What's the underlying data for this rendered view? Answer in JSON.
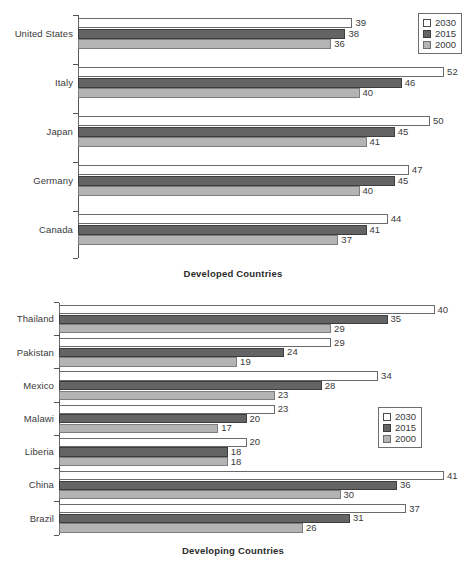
{
  "chart_data": [
    {
      "type": "bar",
      "orientation": "horizontal",
      "title": "",
      "xlabel": "Developed Countries",
      "ylabel": "",
      "grid": false,
      "xlim": [
        0,
        52
      ],
      "legend_position": "top-right",
      "categories": [
        "United States",
        "Italy",
        "Japan",
        "Germany",
        "Canada"
      ],
      "series": [
        {
          "name": "2030",
          "color": "#ffffff",
          "values": [
            39,
            52,
            50,
            47,
            44
          ]
        },
        {
          "name": "2015",
          "color": "#646464",
          "values": [
            38,
            46,
            45,
            45,
            41
          ]
        },
        {
          "name": "2000",
          "color": "#b4b4b4",
          "values": [
            36,
            40,
            41,
            40,
            37
          ]
        }
      ]
    },
    {
      "type": "bar",
      "orientation": "horizontal",
      "title": "",
      "xlabel": "Developing Countries",
      "ylabel": "",
      "grid": false,
      "xlim": [
        0,
        41
      ],
      "legend_position": "middle-right",
      "categories": [
        "Thailand",
        "Pakistan",
        "Mexico",
        "Malawi",
        "Liberia",
        "China",
        "Brazil"
      ],
      "series": [
        {
          "name": "2030",
          "color": "#ffffff",
          "values": [
            40,
            29,
            34,
            23,
            20,
            41,
            37
          ]
        },
        {
          "name": "2015",
          "color": "#646464",
          "values": [
            35,
            24,
            28,
            20,
            18,
            36,
            31
          ]
        },
        {
          "name": "2000",
          "color": "#b4b4b4",
          "values": [
            29,
            19,
            23,
            17,
            18,
            30,
            26
          ]
        }
      ]
    }
  ],
  "legend": {
    "items": [
      {
        "label": "2030",
        "swatch": "white-square-icon"
      },
      {
        "label": "2015",
        "swatch": "dark-gray-square-icon"
      },
      {
        "label": "2000",
        "swatch": "light-gray-square-icon"
      }
    ]
  }
}
